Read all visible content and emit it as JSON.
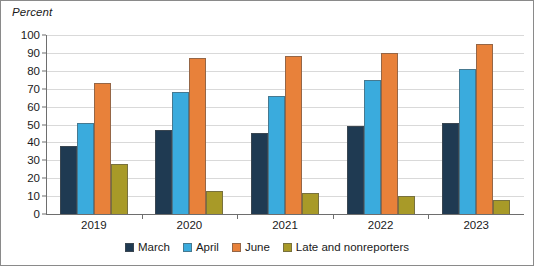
{
  "chart_data": {
    "type": "bar",
    "title": "",
    "subtitle": "",
    "xlabel": "",
    "ylabel": "Percent",
    "ylim": [
      0,
      100
    ],
    "ytick_step": 10,
    "yticks": [
      0,
      10,
      20,
      30,
      40,
      50,
      60,
      70,
      80,
      90,
      100
    ],
    "grid": true,
    "legend_position": "bottom",
    "categories": [
      "2019",
      "2020",
      "2021",
      "2022",
      "2023"
    ],
    "series": [
      {
        "name": "March",
        "color": "#1f3a52",
        "values": [
          38,
          47,
          45,
          49,
          51
        ]
      },
      {
        "name": "April",
        "color": "#3aabdd",
        "values": [
          51,
          68,
          66,
          75,
          81
        ]
      },
      {
        "name": "June",
        "color": "#e8813a",
        "values": [
          73,
          87,
          88,
          90,
          95
        ]
      },
      {
        "name": "Late and nonreporters",
        "color": "#a89a28",
        "values": [
          28,
          13,
          12,
          10,
          8
        ]
      }
    ]
  },
  "legend": {
    "items": [
      {
        "label": "March"
      },
      {
        "label": "April"
      },
      {
        "label": "June"
      },
      {
        "label": "Late and nonreporters"
      }
    ]
  }
}
